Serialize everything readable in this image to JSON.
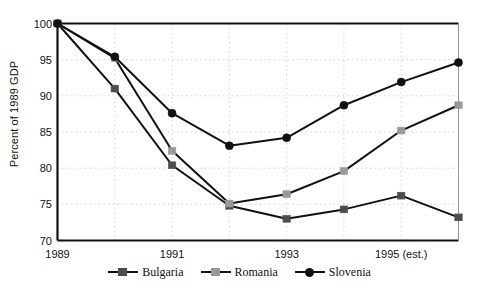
{
  "chart_data": {
    "type": "line",
    "title": "",
    "subtitle": "",
    "xlabel": "",
    "ylabel": "Percent of 1989 GDP",
    "ylim": [
      70,
      100
    ],
    "yticks": [
      70,
      75,
      80,
      85,
      90,
      95,
      100
    ],
    "xlim": [
      1989,
      1996
    ],
    "xticks": [
      1989,
      1991,
      1993,
      1995
    ],
    "xticklabels": [
      "1989",
      "1991",
      "1993",
      "1995 (est.)"
    ],
    "grid": true,
    "grid_style": "dotted",
    "legend_position": "bottom",
    "x": [
      1989,
      1990,
      1991,
      1992,
      1993,
      1994,
      1995,
      1996
    ],
    "series": [
      {
        "name": "Bulgaria",
        "color": "#4d4d4d",
        "marker": "square",
        "values": [
          100.0,
          91.0,
          80.4,
          74.8,
          73.0,
          74.3,
          76.2,
          73.2
        ]
      },
      {
        "name": "Romania",
        "color": "#999999",
        "marker": "square",
        "values": [
          100.0,
          95.2,
          82.4,
          75.1,
          76.4,
          79.6,
          85.2,
          88.7
        ]
      },
      {
        "name": "Slovenia",
        "color": "#111111",
        "marker": "circle",
        "values": [
          100.0,
          95.4,
          87.6,
          83.1,
          84.2,
          88.7,
          91.9,
          94.6
        ]
      }
    ]
  },
  "legend": {
    "items": [
      {
        "label": "Bulgaria",
        "marker": "square",
        "color": "#4d4d4d"
      },
      {
        "label": "Romania",
        "marker": "square",
        "color": "#999999"
      },
      {
        "label": "Slovenia",
        "marker": "circle",
        "color": "#111111"
      }
    ]
  },
  "axes": {
    "frame_color": "#111111",
    "grid_color": "#b9b9b9"
  }
}
